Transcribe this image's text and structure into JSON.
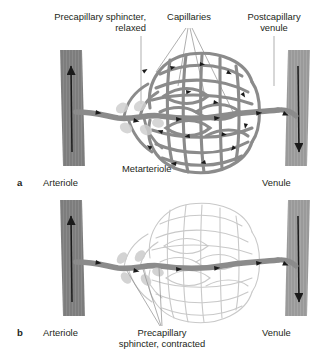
{
  "figure": {
    "background_color": "#ffffff",
    "colors": {
      "arteriole_fill": "#7d7d7d",
      "venule_fill": "#9a9a9a",
      "vessel_gray": "#8b8b8b",
      "vessel_open_stroke": "#858585",
      "vessel_closed_stroke": "#c9c9c9",
      "sphincter_fill": "#cfcfcf",
      "arrow_black": "#1a1a1a",
      "leader_line": "#8c8c8c",
      "text": "#231f20"
    },
    "panels": [
      {
        "key": "a",
        "panel_label": "a",
        "state": "relaxed",
        "description": "Precapillary sphincters relaxed: blood flows through the entire capillary bed",
        "labels": [
          {
            "name": "precapillary-sphincter-relaxed",
            "lines": [
              "Precapillary sphincter,",
              "relaxed"
            ],
            "align": "right"
          },
          {
            "name": "capillaries",
            "lines": [
              "Capillaries"
            ],
            "align": "middle"
          },
          {
            "name": "postcapillary-venule",
            "lines": [
              "Postcapillary",
              "venule"
            ],
            "align": "middle"
          },
          {
            "name": "metarteriole",
            "lines": [
              "Metarteriole"
            ],
            "align": "left"
          },
          {
            "name": "arteriole",
            "lines": [
              "Arteriole"
            ],
            "align": "left"
          },
          {
            "name": "venule",
            "lines": [
              "Venule"
            ],
            "align": "left"
          }
        ]
      },
      {
        "key": "b",
        "panel_label": "b",
        "state": "contracted",
        "description": "Precapillary sphincters contracted: blood bypasses the capillary bed via the thoroughfare channel",
        "labels": [
          {
            "name": "precapillary-sphincter-contracted",
            "lines": [
              "Precapillary",
              "sphincter, contracted"
            ],
            "align": "middle"
          },
          {
            "name": "arteriole",
            "lines": [
              "Arteriole"
            ],
            "align": "left"
          },
          {
            "name": "venule",
            "lines": [
              "Venule"
            ],
            "align": "left"
          }
        ]
      }
    ],
    "text": {
      "precap_sphincter_relaxed_l1": "Precapillary sphincter,",
      "precap_sphincter_relaxed_l2": "relaxed",
      "capillaries": "Capillaries",
      "postcapillary_venule_l1": "Postcapillary",
      "postcapillary_venule_l2": "venule",
      "metarteriole": "Metarteriole",
      "panel_a": "a",
      "arteriole_a": "Arteriole",
      "venule_a": "Venule",
      "panel_b": "b",
      "arteriole_b": "Arteriole",
      "venule_b": "Venule",
      "precap_sphincter_contracted_l1": "Precapillary",
      "precap_sphincter_contracted_l2": "sphincter, contracted"
    }
  }
}
